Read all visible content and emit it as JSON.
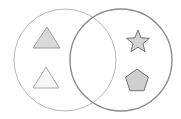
{
  "diagram": {
    "type": "venn",
    "background": "#ffffff",
    "sets": [
      {
        "name": "left-set",
        "cx": 65,
        "cy": 60,
        "r": 51,
        "stroke": "#b8b8b8",
        "stroke_width": 1
      },
      {
        "name": "right-set",
        "cx": 121,
        "cy": 60,
        "r": 51,
        "stroke": "#8c8c8c",
        "stroke_width": 1.4
      }
    ],
    "shapes": [
      {
        "kind": "triangle",
        "set": "left",
        "fill": "#d9d9d9",
        "stroke": "#9a9a9a",
        "points": "47,27 60,48 33,48"
      },
      {
        "kind": "triangle",
        "set": "left",
        "fill": "#f7f7f7",
        "stroke": "#a8a8a8",
        "points": "46,67 59,88 33,88"
      },
      {
        "kind": "star",
        "set": "right",
        "fill": "#d4d4d4",
        "stroke": "#707070",
        "cx": 138,
        "cy": 42,
        "r_outer": 12,
        "r_inner": 5.2
      },
      {
        "kind": "pentagon",
        "set": "right",
        "fill": "#cfcfcf",
        "stroke": "#707070",
        "cx": 137,
        "cy": 81,
        "r": 12
      }
    ]
  }
}
